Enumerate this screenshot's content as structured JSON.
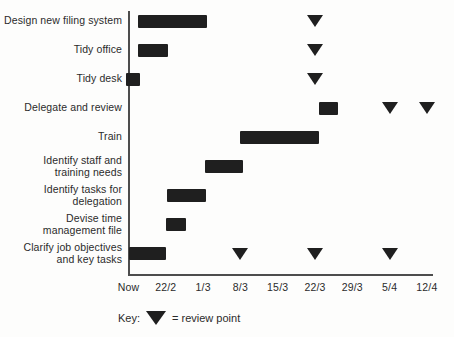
{
  "figure": {
    "background": "#fdfdfc",
    "bar_color": "#1f1f1f",
    "text_color": "#2b2b2b",
    "axis_color": "#4d4d4d"
  },
  "key": {
    "label": "Key:",
    "marker": "review-point-triangle",
    "description": "= review point"
  },
  "chart_data": {
    "type": "bar",
    "variant": "gantt",
    "title": "",
    "xlabel": "",
    "ylabel": "",
    "grid": false,
    "legend_position": "bottom",
    "x_axis": {
      "tick_labels": [
        "Now",
        "22/2",
        "1/3",
        "8/3",
        "15/3",
        "22/3",
        "29/3",
        "5/4",
        "12/4"
      ],
      "note": "tick unit = one interval between adjacent date labels"
    },
    "tasks": [
      {
        "label": "Design new filing system",
        "start_tick": 0.25,
        "end_tick": 2.1,
        "review_points_ticks": [
          5
        ]
      },
      {
        "label": "Tidy office",
        "start_tick": 0.25,
        "end_tick": 1.06,
        "review_points_ticks": [
          5
        ]
      },
      {
        "label": "Tidy desk",
        "start_tick": -0.07,
        "end_tick": 0.3,
        "review_points_ticks": [
          5
        ]
      },
      {
        "label": "Delegate and review",
        "start_tick": 5.1,
        "end_tick": 5.62,
        "review_points_ticks": [
          7,
          8
        ]
      },
      {
        "label": "Train",
        "start_tick": 3.0,
        "end_tick": 5.12,
        "review_points_ticks": []
      },
      {
        "label": "Identify staff and\ntraining needs",
        "start_tick": 2.05,
        "end_tick": 3.06,
        "review_points_ticks": []
      },
      {
        "label": "Identify tasks for\ndelegation",
        "start_tick": 1.03,
        "end_tick": 2.07,
        "review_points_ticks": []
      },
      {
        "label": "Devise time\nmanagement file",
        "start_tick": 1.0,
        "end_tick": 1.54,
        "review_points_ticks": []
      },
      {
        "label": "Clarify job objectives\nand key tasks",
        "start_tick": 0.0,
        "end_tick": 1.0,
        "review_points_ticks": [
          3,
          5,
          7
        ]
      }
    ]
  }
}
